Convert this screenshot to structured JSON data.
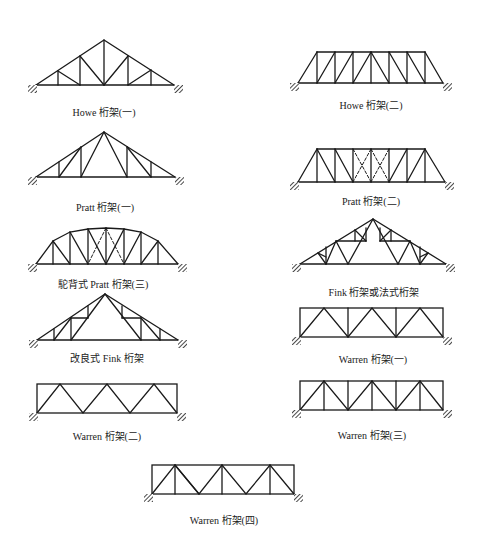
{
  "diagram": {
    "trusses": [
      {
        "id": "howe-1",
        "label": "Howe 桁架(一)"
      },
      {
        "id": "howe-2",
        "label": "Howe 桁架(二)"
      },
      {
        "id": "pratt-1",
        "label": "Pratt 桁架(一)"
      },
      {
        "id": "pratt-2",
        "label": "Pratt 桁架(二)"
      },
      {
        "id": "camelback-pratt",
        "label": "駝背式 Pratt 桁架(三)"
      },
      {
        "id": "fink",
        "label": "Fink 桁架或法式桁架"
      },
      {
        "id": "modified-fink",
        "label": "改良式 Fink 桁架"
      },
      {
        "id": "warren-1",
        "label": "Warren 桁架(一)"
      },
      {
        "id": "warren-2",
        "label": "Warren 桁架(二)"
      },
      {
        "id": "warren-3",
        "label": "Warren 桁架(三)"
      },
      {
        "id": "warren-4",
        "label": "Warren 桁架(四)"
      }
    ]
  },
  "colors": {
    "line": "#1a1a1a",
    "background": "#ffffff"
  }
}
